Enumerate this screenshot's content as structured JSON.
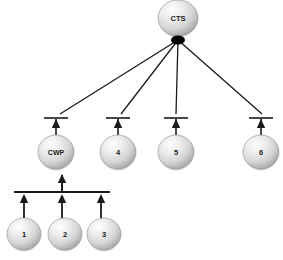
{
  "diagram": {
    "type": "tree",
    "background_color": "#ffffff",
    "edge_color": "#1a1a1a",
    "node_fill_light": "#f2f2f2",
    "node_fill_mid": "#d9d9d9",
    "node_fill_dark": "#a6a6a6",
    "node_stroke": "#8c8c8c",
    "label_color": "#1a1a1a",
    "junction_color": "#000000",
    "nodes": [
      {
        "id": "cts",
        "label": "CTS",
        "cx": 178,
        "cy": 18,
        "rx": 20,
        "ry": 18,
        "font_size": 7.5
      },
      {
        "id": "cwp",
        "label": "CWP",
        "cx": 56,
        "cy": 152,
        "rx": 18,
        "ry": 17,
        "font_size": 7
      },
      {
        "id": "n4",
        "label": "4",
        "cx": 118,
        "cy": 152,
        "rx": 18,
        "ry": 17,
        "font_size": 7.5
      },
      {
        "id": "n5",
        "label": "5",
        "cx": 176,
        "cy": 152,
        "rx": 18,
        "ry": 17,
        "font_size": 7.5
      },
      {
        "id": "n6",
        "label": "6",
        "cx": 261,
        "cy": 152,
        "rx": 18,
        "ry": 17,
        "font_size": 7.5
      },
      {
        "id": "n1",
        "label": "1",
        "cx": 24,
        "cy": 234,
        "rx": 17,
        "ry": 16,
        "font_size": 7.5
      },
      {
        "id": "n2",
        "label": "2",
        "cx": 65,
        "cy": 234,
        "rx": 17,
        "ry": 16,
        "font_size": 7.5
      },
      {
        "id": "n3",
        "label": "3",
        "cx": 104,
        "cy": 234,
        "rx": 17,
        "ry": 16,
        "font_size": 7.5
      }
    ],
    "junction": {
      "cx": 178,
      "cy": 40,
      "rx": 7,
      "ry": 4.5
    },
    "fan_edges": [
      {
        "id": "edge-cts-cwp",
        "from": "cts",
        "to": "cwp",
        "x1": 178,
        "y1": 40,
        "x2": 60,
        "y2": 114
      },
      {
        "id": "edge-cts-4",
        "from": "cts",
        "to": "n4",
        "x1": 178,
        "y1": 40,
        "x2": 121,
        "y2": 114
      },
      {
        "id": "edge-cts-5",
        "from": "cts",
        "to": "n5",
        "x1": 178,
        "y1": 40,
        "x2": 176,
        "y2": 114
      },
      {
        "id": "edge-cts-6",
        "from": "cts",
        "to": "n6",
        "x1": 178,
        "y1": 40,
        "x2": 262,
        "y2": 114
      }
    ],
    "arrow_stems": [
      {
        "id": "stem-cwp",
        "x": 56,
        "y_top": 119,
        "y_bottom": 135
      },
      {
        "id": "stem-4",
        "x": 118,
        "y_top": 119,
        "y_bottom": 135
      },
      {
        "id": "stem-5",
        "x": 176,
        "y_top": 119,
        "y_bottom": 135
      },
      {
        "id": "stem-6",
        "x": 261,
        "y_top": 119,
        "y_bottom": 135
      }
    ],
    "cross_bars": [
      {
        "id": "bar-cwp",
        "x1": 44,
        "x2": 68,
        "y": 118
      },
      {
        "id": "bar-4",
        "x1": 106,
        "x2": 130,
        "y": 118
      },
      {
        "id": "bar-5",
        "x1": 164,
        "x2": 188,
        "y": 118
      },
      {
        "id": "bar-6",
        "x1": 249,
        "x2": 273,
        "y": 118
      }
    ],
    "upper_arrowheads": [
      {
        "id": "arrowhead-cwp",
        "x": 56,
        "y": 119
      },
      {
        "id": "arrowhead-4",
        "x": 118,
        "y": 119
      },
      {
        "id": "arrowhead-5",
        "x": 176,
        "y": 119
      },
      {
        "id": "arrowhead-6",
        "x": 261,
        "y": 119
      }
    ],
    "cwp_stem": {
      "id": "stem-cwp-lower",
      "x": 62,
      "y_top": 175,
      "y_bottom": 192
    },
    "cwp_arrowhead": {
      "id": "arrowhead-cwp-lower",
      "x": 62,
      "y": 174
    },
    "lower_bar": {
      "id": "bar-lower",
      "x1": 14,
      "x2": 110,
      "y": 192
    },
    "lower_stems": [
      {
        "id": "stem-1",
        "x": 24,
        "y_top": 196,
        "y_bottom": 219
      },
      {
        "id": "stem-2",
        "x": 62,
        "y_top": 196,
        "y_bottom": 219
      },
      {
        "id": "stem-3",
        "x": 101,
        "y_top": 196,
        "y_bottom": 219
      }
    ],
    "lower_arrowheads": [
      {
        "id": "arrowhead-1",
        "x": 24,
        "y": 194
      },
      {
        "id": "arrowhead-2",
        "x": 62,
        "y": 194
      },
      {
        "id": "arrowhead-3",
        "x": 101,
        "y": 194
      }
    ]
  }
}
